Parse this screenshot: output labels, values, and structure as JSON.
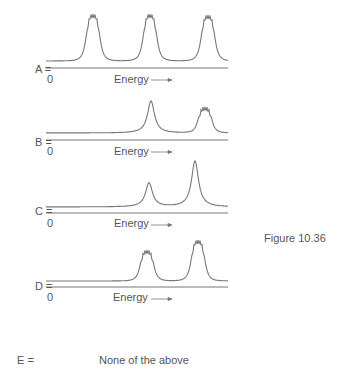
{
  "figure": {
    "caption": "Figure 10.36",
    "line_color": "#777777",
    "text_color": "#555555"
  },
  "chart_data": {
    "type": "line",
    "title": "",
    "figure_label": "Figure 10.36",
    "xlabel": "Energy →",
    "ylabel": "",
    "x_origin_tick": "0",
    "grid": false,
    "panels": [
      {
        "option": "A =",
        "xlabel": "Energy",
        "origin": "0",
        "peaks": [
          {
            "position": 93,
            "height": 47,
            "shape": "multiplet"
          },
          {
            "position": 150,
            "height": 47,
            "shape": "multiplet"
          },
          {
            "position": 208,
            "height": 46,
            "shape": "multiplet"
          }
        ]
      },
      {
        "option": "B =",
        "xlabel": "Energy",
        "origin": "0",
        "peaks": [
          {
            "position": 151,
            "height": 32,
            "shape": "single"
          },
          {
            "position": 205,
            "height": 26,
            "shape": "multiplet"
          }
        ]
      },
      {
        "option": "C =",
        "xlabel": "Energy",
        "origin": "0",
        "peaks": [
          {
            "position": 149,
            "height": 24,
            "shape": "single"
          },
          {
            "position": 195,
            "height": 46,
            "shape": "single"
          }
        ]
      },
      {
        "option": "D =",
        "xlabel": "Energy",
        "origin": "0",
        "peaks": [
          {
            "position": 147,
            "height": 31,
            "shape": "multiplet"
          },
          {
            "position": 198,
            "height": 41,
            "shape": "multiplet"
          }
        ]
      }
    ],
    "extra_option": {
      "option": "E =",
      "text": "None of the above"
    }
  },
  "options": {
    "a": "A =",
    "b": "B =",
    "c": "C =",
    "d": "D =",
    "e": "E =",
    "e_text": "None of the above"
  },
  "axis": {
    "zero": "0",
    "energy": "Energy"
  }
}
